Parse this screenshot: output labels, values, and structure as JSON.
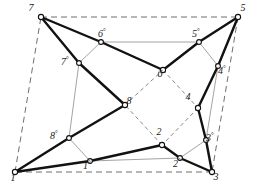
{
  "figure": {
    "width": 258,
    "height": 188,
    "colors": {
      "background": "#ffffff",
      "thick_edge": "#121212",
      "thin_edge": "#8b8b8b",
      "dashed_outer": "#6f6f6f",
      "dashed_inner": "#8a8a8a",
      "node_fill": "#ffffff",
      "node_stroke": "#111111",
      "label": "#1a1a1a"
    }
  },
  "nodes": [
    {
      "id": "n1",
      "label": "1",
      "prime": false,
      "x": 15,
      "y": 172,
      "label_dx": -2,
      "label_dy": 6,
      "r": 2.6
    },
    {
      "id": "n3",
      "label": "3",
      "prime": false,
      "x": 212,
      "y": 172,
      "label_dx": 4,
      "label_dy": 5,
      "r": 2.6
    },
    {
      "id": "n5",
      "label": "5",
      "prime": false,
      "x": 238,
      "y": 17,
      "label_dx": 5,
      "label_dy": -9,
      "r": 2.6
    },
    {
      "id": "n7",
      "label": "7",
      "prime": false,
      "x": 41,
      "y": 17,
      "label_dx": -10,
      "label_dy": -9,
      "r": 2.6
    },
    {
      "id": "n2",
      "label": "2",
      "prime": false,
      "x": 162,
      "y": 145,
      "label_dx": -3,
      "label_dy": -13,
      "r": 2.6
    },
    {
      "id": "n4",
      "label": "4",
      "prime": false,
      "x": 198,
      "y": 108,
      "label_dx": -10,
      "label_dy": -11,
      "r": 2.6
    },
    {
      "id": "n6",
      "label": "6",
      "prime": false,
      "x": 163,
      "y": 70,
      "label_dx": -3,
      "label_dy": 4,
      "r": 2.6
    },
    {
      "id": "n8",
      "label": "8",
      "prime": false,
      "x": 125,
      "y": 105,
      "label_dx": 4,
      "label_dy": -4,
      "r": 2.6
    },
    {
      "id": "n1p",
      "label": "1",
      "prime": true,
      "x": 90,
      "y": 161,
      "label_dx": -3,
      "label_dy": 4,
      "r": 2.4
    },
    {
      "id": "n2p",
      "label": "2",
      "prime": true,
      "x": 180,
      "y": 158,
      "label_dx": -3,
      "label_dy": 5,
      "r": 2.4
    },
    {
      "id": "n3p",
      "label": "3",
      "prime": true,
      "x": 206,
      "y": 140,
      "label_dx": 4,
      "label_dy": -3,
      "r": 2.4
    },
    {
      "id": "n4p",
      "label": "4",
      "prime": true,
      "x": 218,
      "y": 66,
      "label_dx": 4,
      "label_dy": 4,
      "r": 2.4
    },
    {
      "id": "n5p",
      "label": "5",
      "prime": true,
      "x": 199,
      "y": 42,
      "label_dx": -3,
      "label_dy": -9,
      "r": 2.4
    },
    {
      "id": "n6p",
      "label": "6",
      "prime": true,
      "x": 101,
      "y": 42,
      "label_dx": 1,
      "label_dy": -9,
      "r": 2.4
    },
    {
      "id": "n7p",
      "label": "7",
      "prime": true,
      "x": 79,
      "y": 63,
      "label_dx": -14,
      "label_dy": -2,
      "r": 2.4
    },
    {
      "id": "n8p",
      "label": "8",
      "prime": true,
      "x": 69,
      "y": 138,
      "label_dx": -15,
      "label_dy": -3,
      "r": 2.4
    }
  ],
  "edges": {
    "outer_dashed": [
      {
        "from": "n7",
        "to": "n5"
      },
      {
        "from": "n5",
        "to": "n3"
      },
      {
        "from": "n3",
        "to": "n1"
      },
      {
        "from": "n1",
        "to": "n7"
      }
    ],
    "inner_dashed": [
      {
        "from": "n8",
        "to": "n6"
      },
      {
        "from": "n6",
        "to": "n4"
      },
      {
        "from": "n4",
        "to": "n2"
      },
      {
        "from": "n2",
        "to": "n8"
      }
    ],
    "thin": [
      {
        "from": "n6p",
        "to": "n5p"
      },
      {
        "from": "n1p",
        "to": "n2p"
      },
      {
        "from": "n7p",
        "to": "n8p"
      },
      {
        "from": "n4p",
        "to": "n3p"
      },
      {
        "from": "n6p",
        "to": "n7p"
      },
      {
        "from": "n5p",
        "to": "n4p"
      },
      {
        "from": "n1p",
        "to": "n8p"
      },
      {
        "from": "n2p",
        "to": "n3p"
      }
    ],
    "thick": [
      {
        "from": "n7",
        "to": "n6p"
      },
      {
        "from": "n6p",
        "to": "n6"
      },
      {
        "from": "n7",
        "to": "n7p"
      },
      {
        "from": "n7p",
        "to": "n8"
      },
      {
        "from": "n5",
        "to": "n5p"
      },
      {
        "from": "n5p",
        "to": "n6"
      },
      {
        "from": "n5",
        "to": "n4p"
      },
      {
        "from": "n4p",
        "to": "n4"
      },
      {
        "from": "n1",
        "to": "n1p"
      },
      {
        "from": "n1p",
        "to": "n2"
      },
      {
        "from": "n1",
        "to": "n8p"
      },
      {
        "from": "n8p",
        "to": "n8"
      },
      {
        "from": "n3",
        "to": "n2p"
      },
      {
        "from": "n2p",
        "to": "n2"
      },
      {
        "from": "n3",
        "to": "n3p"
      },
      {
        "from": "n3p",
        "to": "n4"
      }
    ]
  }
}
